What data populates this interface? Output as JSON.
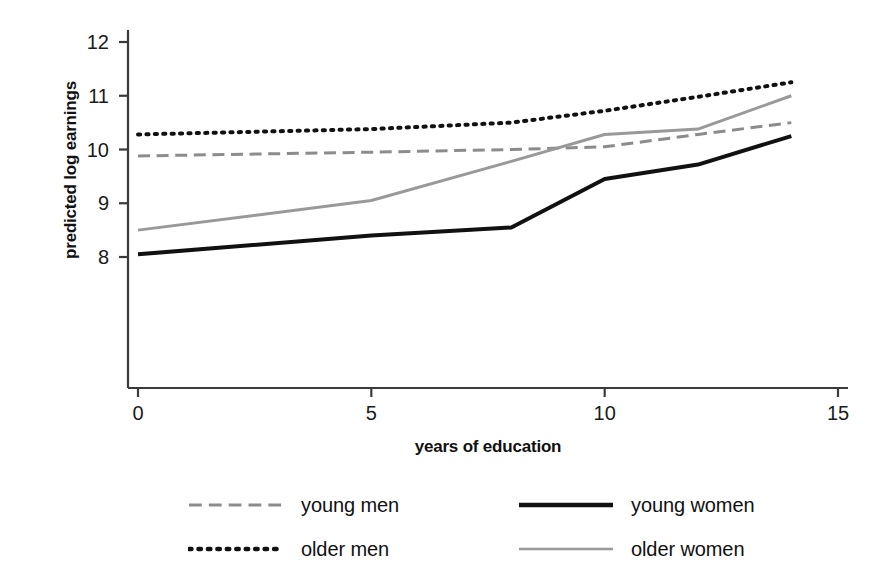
{
  "chart_data": {
    "type": "line",
    "title": "",
    "xlabel": "years of education",
    "ylabel": "predicted log earnings",
    "xlim": [
      0,
      15
    ],
    "ylim": [
      7.4,
      12
    ],
    "xticks": [
      0,
      5,
      10,
      15
    ],
    "xtick_labels": [
      "0",
      "5",
      "10",
      "15"
    ],
    "yticks": [
      8,
      9,
      10,
      11,
      12
    ],
    "ytick_labels": [
      "8",
      "9",
      "10",
      "11",
      "12"
    ],
    "grid": false,
    "legend_position": "bottom",
    "series": [
      {
        "name": "young men",
        "style": "dashed",
        "color": "#8c8c8c",
        "width": 3,
        "x": [
          0,
          5,
          8,
          10,
          12,
          14
        ],
        "y": [
          9.88,
          9.95,
          10.0,
          10.05,
          10.28,
          10.5
        ]
      },
      {
        "name": "older men",
        "style": "dotted",
        "color": "#111111",
        "width": 4,
        "x": [
          0,
          5,
          8,
          10,
          12,
          14
        ],
        "y": [
          10.28,
          10.38,
          10.5,
          10.72,
          10.98,
          11.25
        ]
      },
      {
        "name": "young women",
        "style": "solid",
        "color": "#111111",
        "width": 4,
        "x": [
          0,
          5,
          8,
          10,
          12,
          14
        ],
        "y": [
          8.05,
          8.4,
          8.55,
          9.45,
          9.72,
          10.25
        ]
      },
      {
        "name": "older women",
        "style": "solid",
        "color": "#999999",
        "width": 3,
        "x": [
          0,
          5,
          8,
          10,
          12,
          14
        ],
        "y": [
          8.5,
          9.05,
          9.78,
          10.28,
          10.38,
          11.0
        ]
      }
    ]
  },
  "axis": {
    "y_title": "predicted log earnings",
    "x_title": "years of education"
  },
  "legend": {
    "items": [
      {
        "label": "young men",
        "style": "dashed",
        "color": "#8c8c8c"
      },
      {
        "label": "young women",
        "style": "solid",
        "color": "#111111"
      },
      {
        "label": "older men",
        "style": "dotted",
        "color": "#111111"
      },
      {
        "label": "older women",
        "style": "solid",
        "color": "#999999"
      }
    ]
  },
  "colors": {
    "axis": "#3a3a3a",
    "dark_series": "#111111",
    "light_series": "#999999",
    "mid_series": "#8c8c8c",
    "background": "#ffffff"
  }
}
